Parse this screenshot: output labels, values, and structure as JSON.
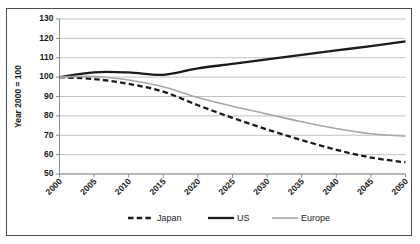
{
  "chart_data": {
    "type": "line",
    "title": "",
    "xlabel": "",
    "ylabel": "Year 2000 = 100",
    "x": [
      2000,
      2005,
      2010,
      2015,
      2020,
      2025,
      2030,
      2035,
      2040,
      2045,
      2050
    ],
    "xtick_labels": [
      "2000",
      "2005",
      "2010",
      "2015",
      "2020",
      "2025",
      "2030",
      "2035",
      "2040",
      "2045",
      "2050"
    ],
    "ytick_labels": [
      "50",
      "60",
      "70",
      "80",
      "90",
      "100",
      "110",
      "120",
      "130"
    ],
    "yticks": [
      50,
      60,
      70,
      80,
      90,
      100,
      110,
      120,
      130
    ],
    "ylim": [
      50,
      130
    ],
    "xlim": [
      2000,
      2050
    ],
    "grid": true,
    "legend_position": "bottom",
    "series": [
      {
        "name": "Japan",
        "color": "#1a1a1a",
        "style": "dashed",
        "width": 2.3,
        "x": [
          2000,
          2005,
          2010,
          2015,
          2020,
          2025,
          2030,
          2035,
          2040,
          2045,
          2050
        ],
        "values": [
          100,
          99,
          96.5,
          92.5,
          85.5,
          79,
          73,
          67.5,
          62.5,
          58.5,
          56
        ]
      },
      {
        "name": "US",
        "color": "#1a1a1a",
        "style": "solid",
        "width": 2.3,
        "x": [
          2000,
          2005,
          2010,
          2015,
          2020,
          2025,
          2030,
          2035,
          2040,
          2045,
          2050
        ],
        "values": [
          100,
          102.5,
          102.4,
          101.2,
          104.5,
          106.8,
          109.2,
          111.5,
          113.8,
          116,
          118.5
        ]
      },
      {
        "name": "Europe",
        "color": "#a6a6a6",
        "style": "solid",
        "width": 1.6,
        "x": [
          2000,
          2005,
          2010,
          2015,
          2020,
          2025,
          2030,
          2035,
          2040,
          2045,
          2050
        ],
        "values": [
          100,
          100.3,
          98.5,
          95,
          89.5,
          85,
          81,
          77,
          73.5,
          70.8,
          69.5
        ]
      }
    ],
    "legend": [
      {
        "label": "Japan",
        "color": "#1a1a1a",
        "style": "dashed",
        "width": 2.3
      },
      {
        "label": "US",
        "color": "#1a1a1a",
        "style": "solid",
        "width": 2.3
      },
      {
        "label": "Europe",
        "color": "#a6a6a6",
        "style": "solid",
        "width": 1.6
      }
    ]
  },
  "colors": {
    "frame_border": "#4d4d4d",
    "gridline": "#a6a6a6",
    "axis": "#808080",
    "text": "#1a1a1a",
    "background": "#ffffff"
  }
}
